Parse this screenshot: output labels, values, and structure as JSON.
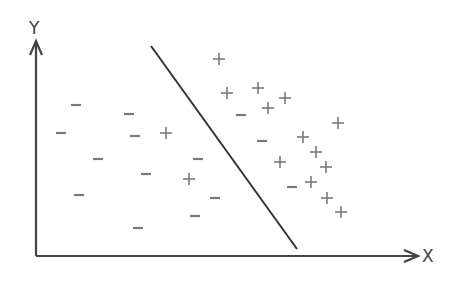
{
  "axes": {
    "x_label": "X",
    "y_label": "Y",
    "origin": [
      36,
      256
    ],
    "x_end": [
      418,
      256
    ],
    "y_end": [
      36,
      41
    ],
    "color": "#444444"
  },
  "decision_boundary": {
    "from": [
      151,
      46
    ],
    "to": [
      297,
      249
    ],
    "color": "#333333"
  },
  "marker_color": "#7a7a7a",
  "points": {
    "positive": [
      [
        219,
        59
      ],
      [
        227,
        93
      ],
      [
        258,
        88
      ],
      [
        285,
        98
      ],
      [
        268,
        108
      ],
      [
        338,
        123
      ],
      [
        303,
        137
      ],
      [
        316,
        152
      ],
      [
        280,
        162
      ],
      [
        326,
        167
      ],
      [
        311,
        182
      ],
      [
        327,
        198
      ],
      [
        341,
        212
      ],
      [
        166,
        133
      ],
      [
        189,
        179
      ]
    ],
    "negative": [
      [
        76,
        105
      ],
      [
        129,
        114
      ],
      [
        61,
        133
      ],
      [
        135,
        136
      ],
      [
        98,
        159
      ],
      [
        146,
        174
      ],
      [
        198,
        159
      ],
      [
        79,
        195
      ],
      [
        215,
        198
      ],
      [
        195,
        216
      ],
      [
        138,
        228
      ],
      [
        241,
        115
      ],
      [
        262,
        141
      ],
      [
        292,
        187
      ]
    ]
  }
}
